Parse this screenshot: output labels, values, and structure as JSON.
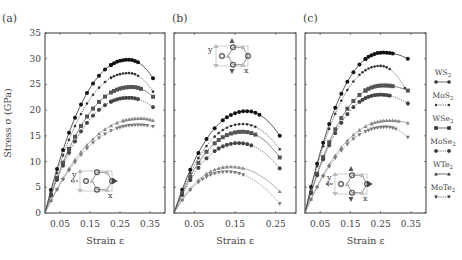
{
  "figure": {
    "ylabel": "Stress σ (GPa)",
    "xlabel": "Strain ε",
    "yticks": [
      "0",
      "5",
      "10",
      "15",
      "20",
      "25",
      "30",
      "35"
    ]
  },
  "legend": [
    {
      "label": "WS",
      "sub": "2",
      "marker": "circle",
      "line": "solid"
    },
    {
      "label": "MoS",
      "sub": "2",
      "marker": "dot",
      "line": "dotted"
    },
    {
      "label": "WSe",
      "sub": "2",
      "marker": "square",
      "line": "solid"
    },
    {
      "label": "MoSe",
      "sub": "2",
      "marker": "pentagon",
      "line": "dotted"
    },
    {
      "label": "WTe",
      "sub": "2",
      "marker": "triangle-up",
      "line": "solid"
    },
    {
      "label": "MoTe",
      "sub": "2",
      "marker": "triangle-down",
      "line": "dotted"
    }
  ],
  "chart_data": [
    {
      "type": "line",
      "title": "(a)",
      "xlabel": "Strain ε",
      "ylabel": "Stress σ (GPa)",
      "xticks": [
        "0.05",
        "0.15",
        "0.25",
        "0.35"
      ],
      "xlim": [
        0,
        0.4
      ],
      "ylim": [
        0,
        35
      ],
      "inset": "armchair lattice, strain along x (bottom-left)",
      "series": [
        {
          "name": "WS2",
          "peak_strain": 0.28,
          "peak_stress": 29.8,
          "end_strain": 0.36,
          "end_stress": 26.2
        },
        {
          "name": "MoS2",
          "peak_strain": 0.28,
          "peak_stress": 27.2,
          "end_strain": 0.36,
          "end_stress": 23.6
        },
        {
          "name": "WSe2",
          "peak_strain": 0.29,
          "peak_stress": 24.5,
          "end_strain": 0.36,
          "end_stress": 22.6
        },
        {
          "name": "MoSe2",
          "peak_strain": 0.28,
          "peak_stress": 22.4,
          "end_strain": 0.36,
          "end_stress": 20.6
        },
        {
          "name": "WTe2",
          "peak_strain": 0.32,
          "peak_stress": 18.4,
          "end_strain": 0.36,
          "end_stress": 18.0
        },
        {
          "name": "MoTe2",
          "peak_strain": 0.31,
          "peak_stress": 17.1,
          "end_strain": 0.36,
          "end_stress": 16.8
        }
      ]
    },
    {
      "type": "line",
      "title": "(b)",
      "xlabel": "Strain ε",
      "ylabel": "",
      "xticks": [
        "0.05",
        "0.15",
        "0.25"
      ],
      "xlim": [
        0,
        0.3
      ],
      "ylim": [
        0,
        35
      ],
      "inset": "lattice, strain along y (top)",
      "series": [
        {
          "name": "WS2",
          "peak_strain": 0.18,
          "peak_stress": 19.8,
          "end_strain": 0.26,
          "end_stress": 15.0
        },
        {
          "name": "MoS2",
          "peak_strain": 0.17,
          "peak_stress": 17.3,
          "end_strain": 0.26,
          "end_stress": 12.4
        },
        {
          "name": "WSe2",
          "peak_strain": 0.17,
          "peak_stress": 15.8,
          "end_strain": 0.26,
          "end_stress": 10.8
        },
        {
          "name": "MoSe2",
          "peak_strain": 0.16,
          "peak_stress": 13.6,
          "end_strain": 0.26,
          "end_stress": 8.7
        },
        {
          "name": "WTe2",
          "peak_strain": 0.14,
          "peak_stress": 9.0,
          "end_strain": 0.26,
          "end_stress": 4.2
        },
        {
          "name": "MoTe2",
          "peak_strain": 0.13,
          "peak_stress": 8.0,
          "end_strain": 0.26,
          "end_stress": 1.8
        }
      ]
    },
    {
      "type": "line",
      "title": "(c)",
      "xlabel": "Strain ε",
      "ylabel": "",
      "xticks": [
        "0.05",
        "0.15",
        "0.25",
        "0.35"
      ],
      "xlim": [
        0,
        0.4
      ],
      "ylim": [
        0,
        35
      ],
      "inset": "lattice, biaxial strain (bottom-center)",
      "series": [
        {
          "name": "WS2",
          "peak_strain": 0.26,
          "peak_stress": 31.2,
          "end_strain": 0.34,
          "end_stress": 30.0
        },
        {
          "name": "MoS2",
          "peak_strain": 0.25,
          "peak_stress": 28.6,
          "end_strain": 0.33,
          "end_stress": 24.3
        },
        {
          "name": "WSe2",
          "peak_strain": 0.26,
          "peak_stress": 24.8,
          "end_strain": 0.34,
          "end_stress": 23.8
        },
        {
          "name": "MoSe2",
          "peak_strain": 0.25,
          "peak_stress": 23.0,
          "end_strain": 0.34,
          "end_stress": 21.3
        },
        {
          "name": "WTe2",
          "peak_strain": 0.28,
          "peak_stress": 18.0,
          "end_strain": 0.34,
          "end_stress": 17.5
        },
        {
          "name": "MoTe2",
          "peak_strain": 0.27,
          "peak_stress": 16.7,
          "end_strain": 0.34,
          "end_stress": 14.7
        }
      ]
    }
  ],
  "colors": {
    "WS2": "#111111",
    "MoS2": "#333333",
    "WSe2": "#555555",
    "MoSe2": "#444444",
    "WTe2": "#888888",
    "MoTe2": "#777777",
    "axis": "#222222"
  }
}
